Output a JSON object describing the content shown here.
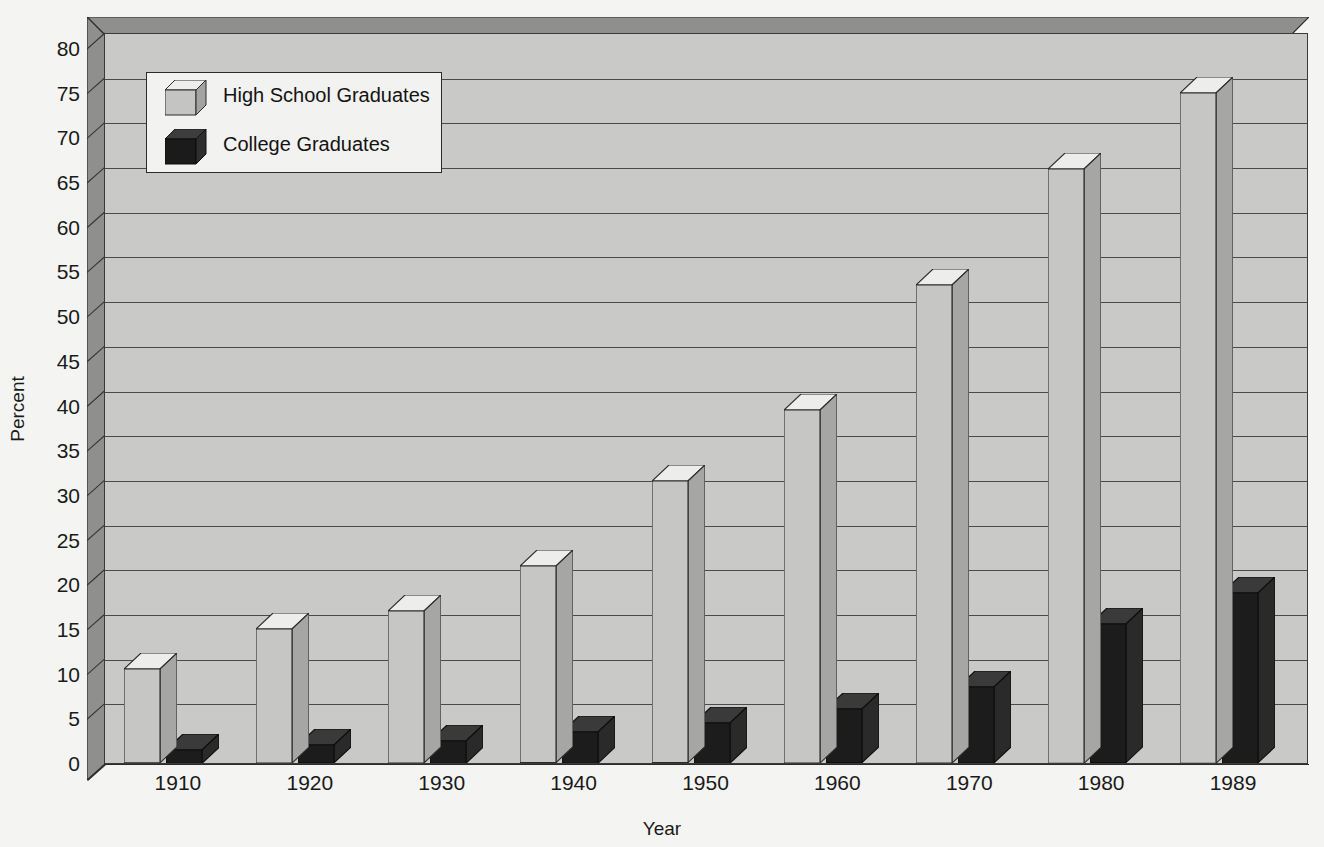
{
  "chart_data": {
    "type": "bar",
    "title": "",
    "subtitle": "",
    "xlabel": "Year",
    "ylabel": "Percent",
    "categories": [
      "1910",
      "1920",
      "1930",
      "1940",
      "1950",
      "1960",
      "1970",
      "1980",
      "1989"
    ],
    "series": [
      {
        "name": "High School Graduates",
        "color": "#c4c4c2",
        "values": [
          10.5,
          15.0,
          17.0,
          22.0,
          31.5,
          39.5,
          53.5,
          66.5,
          75.0
        ]
      },
      {
        "name": "College Graduates",
        "color": "#1f1f1f",
        "values": [
          1.5,
          2.0,
          2.5,
          3.5,
          4.5,
          6.0,
          8.5,
          15.5,
          19.0
        ]
      }
    ],
    "ylim": [
      0,
      80
    ],
    "yticks": [
      0,
      5,
      10,
      15,
      20,
      25,
      30,
      35,
      40,
      45,
      50,
      55,
      60,
      65,
      70,
      75,
      80
    ],
    "ytick_labels": [
      "0",
      "5",
      "10",
      "15",
      "20",
      "25",
      "30",
      "35",
      "40",
      "45",
      "50",
      "55",
      "60",
      "65",
      "70",
      "75",
      "80"
    ],
    "grid": true,
    "grid_axis": "y",
    "legend_position": "top-left",
    "style": "3d-column",
    "background_color": "#c9c9c7",
    "page_background": "#f4f4f2",
    "wall_color": "#8f8f8d",
    "axis_color": "#1a1a1a"
  },
  "legend": {
    "items": [
      {
        "label": "High School Graduates",
        "swatch": "light-gray-cube-icon"
      },
      {
        "label": "College Graduates",
        "swatch": "black-cube-icon"
      }
    ]
  }
}
